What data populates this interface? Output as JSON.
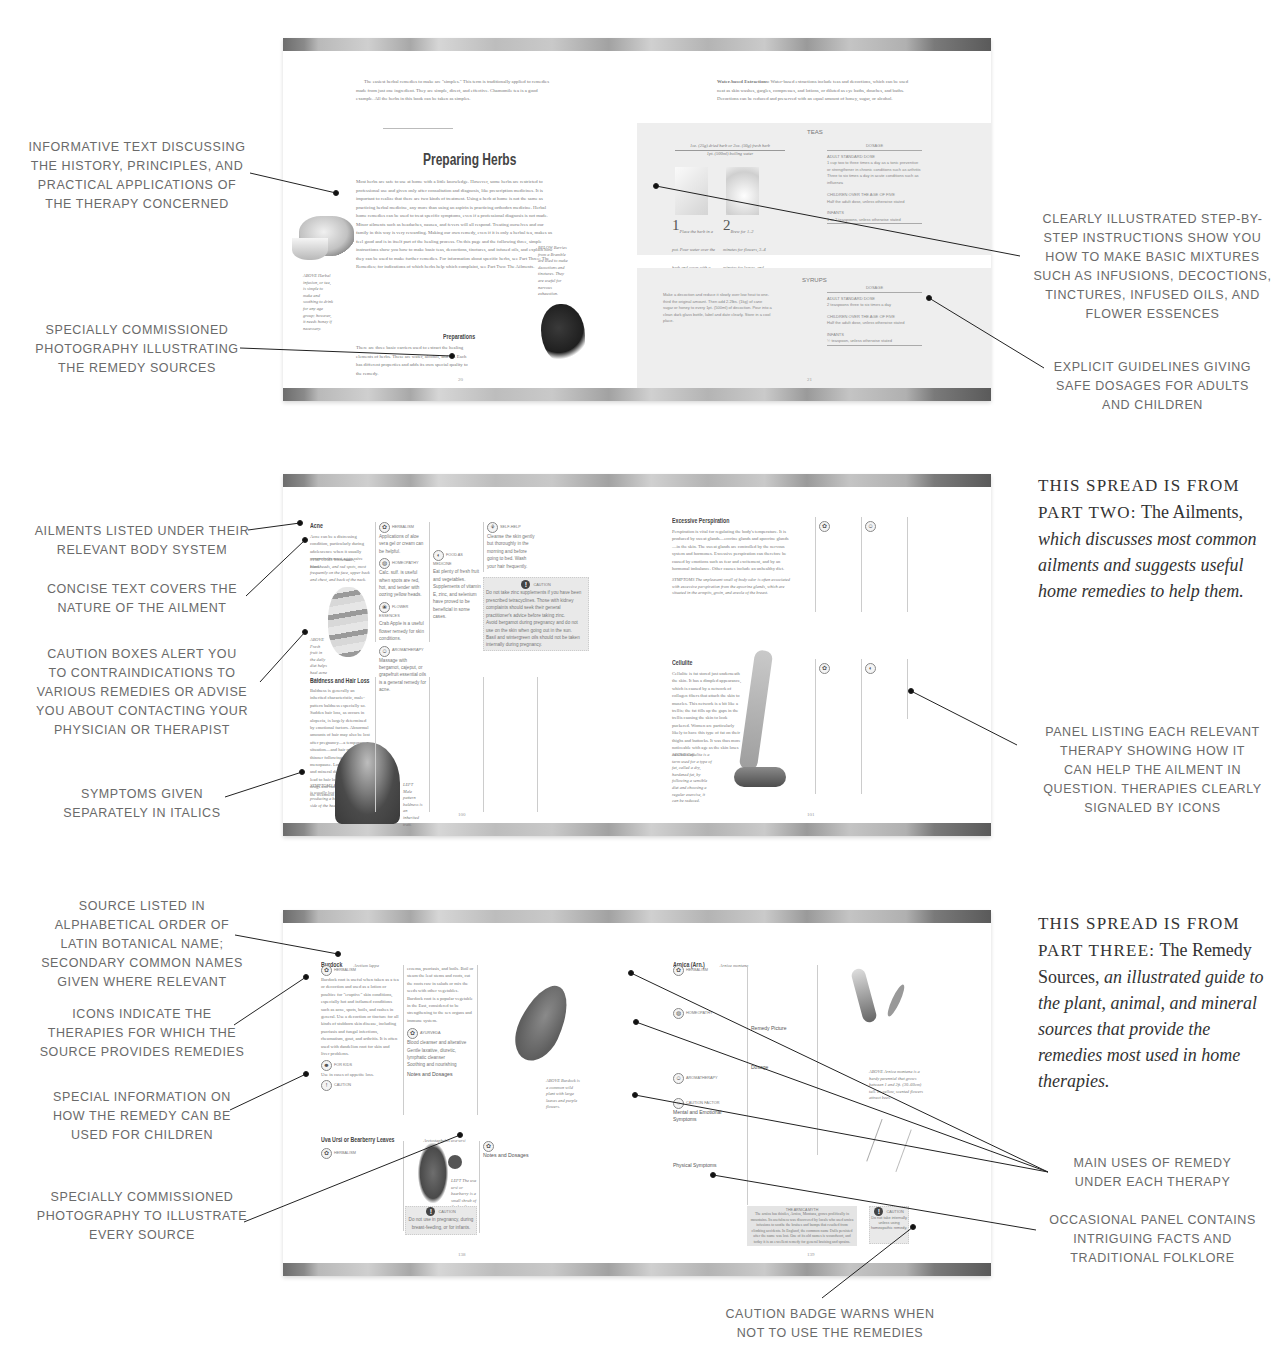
{
  "spread1": {
    "left_page": {
      "intro_paragraph": "The easiest herbal remedies to make are \"simples.\" This term is traditionally applied to remedies made from just one ingredient. They are simple, direct, and effective. Chamomile tea is a good example. All the herbs in this book can be taken as simples.",
      "title": "Preparing Herbs",
      "body": "Most herbs are safe to use at home with a little knowledge. However, some herbs are restricted to professional use and given only after consultation and diagnosis, like prescription medicines. It is important to realize that there are two kinds of treatment. Using a herb at home is not the same as practicing herbal medicine, any more than using an aspirin is practicing orthodox medicine. Herbal home remedies can be used to treat specific symptoms, even if a professional diagnosis is not made. Minor ailments such as headaches, nausea, and fevers will all respond. Treating ourselves and our family in this way is very rewarding. Making our own remedy, even if it is only a herbal tea, makes us feel good and is in itself part of the healing process. On this page and the following three, simple instructions show you how to make basic teas, decoctions, tinctures, and infused oils, and explain how they can be used to make further remedies. For information about specific herbs, see Part Three: The Remedies; for indications of which herbs help which complaint, see Part Two: The Ailments.",
      "subheading": "Preparations",
      "sub_body": "There are three basic carriers used to extract the healing elements of herbs. These are water, alcohol, and oil. Each has different properties and adds its own special quality to the remedy.",
      "caption_left": "ABOVE Herbal infusion, or tea, is simple to make and soothing to drink for any age group; however, it needs honey if necessary.",
      "caption_right": "BELOW Berries from a Bramble are used to make decoctions and tinctures. They are useful for nervous exhaustion.",
      "page_number": "20"
    },
    "right_page": {
      "intro_paragraph_label": "Water-based Extractions:",
      "intro_paragraph": "Water-based extractions include teas and decoctions, which can be used neat as skin washes, gargles, compresses, and lotions, or diluted as eye baths, douches, and baths. Decoctions can be reduced and preserved with an equal amount of honey, sugar, or alcohol.",
      "teas": {
        "title": "TEAS",
        "recipe_line1": "1oz. (25g) dried herb or 2oz. (50g) fresh herb",
        "recipe_line2": "1pt. (500ml) boiling water",
        "step1_num": "1",
        "step1": "Place the herb in a pot. Pour water over the herb and cover with a lid.",
        "step2_num": "2",
        "step2": "Brew for 1–2 minutes for flowers, 3–4 minutes for leaves, and 4–10 minutes for bark, roots, and hard seeds.",
        "dosage_header": "DOSAGE",
        "adult_label": "ADULT STANDARD DOSE",
        "adult_items": [
          "1 cup two to three times a day as a tonic preventive or strengthener in chronic conditions such as arthritis",
          "Three to six times a day in acute conditions such as influenza"
        ],
        "children_label": "CHILDREN OVER THE AGE OF FIVE",
        "children_items": [
          "Half the adult dose, unless otherwise stated"
        ],
        "infants_label": "INFANTS",
        "infants_items": [
          "1 or 2 teaspoons, unless otherwise stated"
        ]
      },
      "syrups": {
        "title": "SYRUPS",
        "body": "Make a decoction and reduce it slowly over low heat to one-third the original amount. Then add 2.2lbs. (1kg) of cane sugar or honey to every 1pt. (500ml) of decoction. Pour into a clean dark glass bottle, label and date clearly. Store in a cool place.",
        "dosage_header": "DOSAGE",
        "adult_label": "ADULT STANDARD DOSE",
        "adult_items": [
          "2 teaspoons three to six times a day"
        ],
        "children_label": "CHILDREN OVER THE AGE OF FIVE",
        "children_items": [
          "Half the adult dose, unless otherwise stated"
        ],
        "infants_label": "INFANTS",
        "infants_items": [
          "½ teaspoon, unless otherwise stated"
        ]
      },
      "page_number": "21"
    },
    "callouts": {
      "informative_text": [
        "INFORMATIVE TEXT DISCUSSING",
        "THE HISTORY, PRINCIPLES, AND",
        "PRACTICAL APPLICATIONS OF",
        "THE THERAPY CONCERNED"
      ],
      "photography": [
        "SPECIALLY COMMISSIONED",
        "PHOTOGRAPHY ILLUSTRATING",
        "THE REMEDY SOURCES"
      ],
      "step_by_step": [
        "CLEARLY ILLUSTRATED STEP-BY-",
        "STEP INSTRUCTIONS SHOW YOU",
        "HOW TO MAKE BASIC MIXTURES",
        "SUCH AS INFUSIONS, DECOCTIONS,",
        "TINCTURES, INFUSED OILS, AND",
        "FLOWER ESSENCES"
      ],
      "dosages": [
        "EXPLICIT GUIDELINES GIVING",
        "SAFE DOSAGES FOR ADULTS",
        "AND CHILDREN"
      ]
    }
  },
  "spread2": {
    "intro": {
      "smallcaps1": "THIS SPREAD IS FROM",
      "smallcaps2": "PART TWO:",
      "roman": "The Ailments,",
      "italic": "which discusses most common ailments and suggests useful home remedies to help them."
    },
    "left_page": {
      "ailment1_title": "Acne",
      "ailment1_body": "Acne can be a distressing condition, particularly during adolescence when it usually occurs in its most aggressive form.",
      "ailment1_symptoms": "SYMPTOMS Whiteheads, blackheads, and red spots, most frequently on the face, upper back and chest, and back of the neck.",
      "ailment1_caption": "ABOVE Fresh fruit in the daily diet helps heal acne at last.",
      "therapies1": [
        {
          "icon": "herbalism-icon",
          "label": "HERBALISM",
          "text": "Applications of aloe vera gel or cream can be helpful."
        },
        {
          "icon": "homeopathy-icon",
          "label": "HOMEOPATHY",
          "text": "Calc. sulf. is useful when spots are red, hot, and tender with oozing yellow heads."
        },
        {
          "icon": "flower-essences-icon",
          "label": "FLOWER ESSENCES",
          "text": "Crab Apple is a useful flower remedy for skin conditions."
        },
        {
          "icon": "aromatherapy-icon",
          "label": "AROMATHERAPY",
          "text": "Massage with bergamot, cajeput, or grapefruit essential oils is a general remedy for acne."
        },
        {
          "icon": "food-as-medicine-icon",
          "label": "FOOD AS MEDICINE",
          "text": "Eat plenty of fresh fruit and vegetables. Supplements of vitamin E, zinc, and selenium have proved to be beneficial in some cases."
        },
        {
          "icon": "self-help-icon",
          "label": "SELF-HELP",
          "text": "Cleanse the skin gently but thoroughly in the morning and before going to bed. Wash your hair frequently."
        }
      ],
      "caution1_label": "CAUTION",
      "caution1_items": [
        "Do not take zinc supplements if you have been prescribed tetracyclines. Those with kidney complaints should seek their general practitioner's advice before taking zinc.",
        "Avoid bergamot during pregnancy and do not use on the skin when going out in the sun.",
        "Basil and wintergreen oils should not be taken internally during pregnancy."
      ],
      "ailment2_title": "Baldness and Hair Loss",
      "ailment2_body": "Baldness is generally an inherited characteristic, male-pattern baldness especially so. Sudden hair loss, as occurs in alopecia, is largely determined by emotional factors. Abnormal amounts of hair may also be lost after pregnancy—a temporary situation—and hair may become thinner following the menopause. Long-term vitamin and mineral deficiencies may lead to hair loss, as will certain drugs and radiotherapy used in the treatment of some cancers.",
      "ailment2_symptoms": "SYMPTOMS In alopecia the hair is usually lost in one area, producing a bald patch on one side of the head.",
      "ailment2_caption": "LEFT Male pattern baldness is an inherited trait.",
      "page_number": "100"
    },
    "right_page": {
      "ailment3_title": "Excessive Perspiration",
      "ailment3_body": "Perspiration is vital for regulating the body's temperature. It is produced by sweat glands—eccrine glands and apocrine glands—in the skin. The sweat glands are controlled by the nervous system and hormones. Excessive perspiration can therefore be caused by emotions such as fear and excitement, and by an hormonal imbalance. Other causes include an unhealthy diet.",
      "ailment3_symptoms": "SYMPTOMS The unpleasant smell of body odor is often associated with excessive perspiration from the apocrine glands, which are situated in the armpits, groin, and areola of the breast.",
      "ailment4_title": "Cellulite",
      "ailment4_body": "Cellulite is fat stored just underneath the skin. It has a dimpled appearance, which is caused by a network of collagen fibers that attach the skin to muscles. This network is a bit like a trellis; the fat fills up the gaps in the trellis causing the skin to look puckered. Women are particularly likely to have this type of fat on their thighs and buttocks. It was thus more noticeable with age as the skin loses its elasticity.",
      "ailment4_caption": "ABOVE Cellulite is a term used for a type of fat, called a dry, hardened fat, by following a sensible diet and choosing a regular exercise, it can be reduced.",
      "page_number": "101"
    },
    "callouts": {
      "body_system": [
        "AILMENTS LISTED UNDER THEIR",
        "RELEVANT BODY SYSTEM"
      ],
      "concise_text": [
        "CONCISE TEXT COVERS THE",
        "NATURE OF THE AILMENT"
      ],
      "caution_boxes": [
        "CAUTION BOXES ALERT YOU",
        "TO CONTRAINDICATIONS TO",
        "VARIOUS REMEDIES OR ADVISE",
        "YOU ABOUT CONTACTING YOUR",
        "PHYSICIAN OR THERAPIST"
      ],
      "symptoms": [
        "SYMPTOMS GIVEN",
        "SEPARATELY IN ITALICS"
      ],
      "therapy_panel": [
        "PANEL LISTING EACH RELEVANT",
        "THERAPY SHOWING HOW IT",
        "CAN HELP THE AILMENT IN",
        "QUESTION. THERAPIES CLEARLY",
        "SIGNALED BY ICONS"
      ]
    }
  },
  "spread3": {
    "intro": {
      "smallcaps1": "THIS SPREAD IS FROM",
      "smallcaps2": "PART THREE:",
      "roman": "The Remedy Sources,",
      "italic": "an illustrated guide to the plant, animal, and mineral sources that provide the remedies most used in home therapies."
    },
    "left_page": {
      "source1_title": "Burdock",
      "source1_latin": "Arctium lappa",
      "source1_herbalism_label": "HERBALISM",
      "source1_herbalism": "Burdock root is useful when taken as a tea or decoction and used as a lotion or poultice for \"eruptive\" skin conditions, especially hot and inflamed conditions such as acne, spots, boils, and rashes in general. Use a decoction or tincture for all kinds of stubborn skin disease, including psoriasis and fungal infections, rheumatism, gout, and arthritis. It is often used with dandelion root for skin and liver problems.",
      "source1_children_label": "FOR KIDS",
      "source1_children": "Use in cases of appetite loss.",
      "source1_caution_label": "CAUTION",
      "source1_col2": "eczema, psoriasis, and boils. Boil or steam the leaf stems and roots, cut the roots raw in salads or mix the seeds with other vegetables. Burdock root is a popular vegetable in the East, considered to be strengthening to the sex organs and immune system.",
      "source1_ayurveda_label": "AYURVEDA",
      "source1_ayurveda_items": [
        "Blood cleanser and alterative",
        "Gentle laxative, diuretic, lymphatic cleanser",
        "Soothing and nourishing",
        "Stimulates the appetite and soothes troubled spirits",
        "Usually astringent"
      ],
      "notes_label": "Notes and Dosages",
      "source1_caption": "ABOVE Burdock is a common wild plant with large leaves and purple flowers.",
      "source2_title": "Uva Ursi or Bearberry Leaves",
      "source2_latin": "Arctostaphylos uva-ursi",
      "source2_herbalism_label": "HERBALISM",
      "source2_caption": "LEFT The uva ursi or bearberry is a small shrub of the heather family, common on moors and mountains.",
      "source2_caution_label": "CAUTION",
      "source2_caution": "Do not use in pregnancy, during breast-feeding, or for infants.",
      "source2_notes_label": "Notes and Dosages",
      "page_number": "138"
    },
    "right_page": {
      "source3_title": "Arnica (Arn.)",
      "source3_latin": "Arnica montana",
      "source3_herbalism_label": "HERBALISM",
      "source3_homeopathy_label": "HOMEOPATHY",
      "source3_aromatherapy_label": "AROMATHERAPY",
      "source3_caution_label": "CAUTION FACTOR",
      "remedy_picture_label": "Remedy Picture",
      "dosage_label": "Dosage",
      "mental_label": "Mental and Emotional Symptoms",
      "physical_label": "Physical Symptoms",
      "folklore_title": "THE ARNICA MYTH",
      "folklore_text": "The arnica has thistles, Arnica, Montana, grows prolifically in mountains. Its usefulness was discovered by locals who used arnica infusions to soothe the bruises and bumps that resulted from climbing accidents. In England, the common name Dulls persisted after the name was lost. One of its old names is woundwort, and today it is an excellent remedy for general bruising and sprains.",
      "badge_label": "CAUTION",
      "badge_text": "Do not take internally unless using homeopathic remedy.",
      "source3_caption": "ABOVE Arnica montana is a hardy perennial that grows between 1 and 2ft. (30–60cm) tall. Its yellow, scented flowers attract bees.",
      "page_number": "139"
    },
    "callouts": {
      "alphabetical": [
        "SOURCE LISTED IN",
        "ALPHABETICAL ORDER OF",
        "LATIN BOTANICAL NAME;",
        "SECONDARY COMMON NAMES",
        "GIVEN WHERE RELEVANT"
      ],
      "icons": [
        "ICONS INDICATE THE",
        "THERAPIES FOR WHICH THE",
        "SOURCE PROVIDES REMEDIES"
      ],
      "children": [
        "SPECIAL INFORMATION ON",
        "HOW THE REMEDY CAN BE",
        "USED FOR CHILDREN"
      ],
      "photography": [
        "SPECIALLY COMMISSIONED",
        "PHOTOGRAPHY TO ILLUSTRATE",
        "EVERY SOURCE"
      ],
      "main_uses": [
        "MAIN USES OF REMEDY",
        "UNDER EACH THERAPY"
      ],
      "folklore": [
        "OCCASIONAL PANEL CONTAINS",
        "INTRIGUING FACTS AND",
        "TRADITIONAL FOLKLORE"
      ],
      "caution_badge": [
        "CAUTION BADGE WARNS WHEN",
        "NOT TO USE THE REMEDIES"
      ]
    }
  },
  "colors": {
    "callout_text": "#6a6a6a",
    "intro_text": "#333333",
    "panel_grey": "#eeeeee",
    "leader_line": "#222222"
  }
}
